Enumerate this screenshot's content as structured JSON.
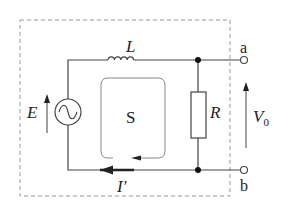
{
  "diagram": {
    "type": "circuit",
    "labels": {
      "inductor": "L",
      "source": "E",
      "resistor": "R",
      "loop": "S",
      "current": "I′",
      "voltage": "V",
      "voltage_sub": "0",
      "terminal_a": "a",
      "terminal_b": "b"
    },
    "components": [
      {
        "id": "source",
        "kind": "ac-voltage-source",
        "label": "E"
      },
      {
        "id": "inductor",
        "kind": "inductor",
        "label": "L"
      },
      {
        "id": "resistor",
        "kind": "resistor",
        "label": "R"
      },
      {
        "id": "terminal_a",
        "kind": "open-terminal",
        "label": "a"
      },
      {
        "id": "terminal_b",
        "kind": "open-terminal",
        "label": "b"
      }
    ],
    "annotations": [
      {
        "kind": "surface-loop",
        "label": "S"
      },
      {
        "kind": "current-arrow",
        "label": "I′",
        "direction": "left"
      },
      {
        "kind": "voltage-arrow",
        "label": "V0",
        "direction": "up"
      },
      {
        "kind": "emf-arrow",
        "label": "E",
        "direction": "up"
      },
      {
        "kind": "dashed-boundary"
      }
    ],
    "colors": {
      "wire": "#444444",
      "dashed": "#9a9a9a",
      "loop": "#888888",
      "text": "#222222"
    }
  }
}
